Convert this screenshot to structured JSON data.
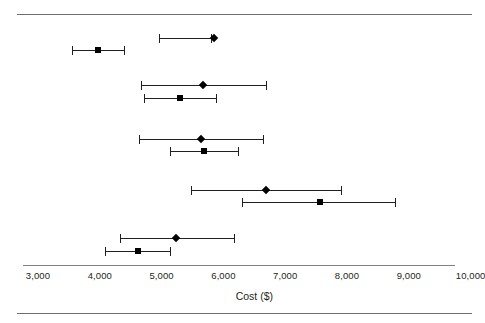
{
  "chart_data": {
    "type": "scatter",
    "title": "",
    "xlabel": "Cost ($)",
    "ylabel": "",
    "xlim": [
      3000,
      10000
    ],
    "grid": false,
    "legend": null,
    "xticks": [
      3000,
      4000,
      5000,
      6000,
      7000,
      8000,
      9000,
      10000
    ],
    "xtick_labels": [
      "3,000",
      "4,000",
      "5,000",
      "6,000",
      "7,000",
      "8,000",
      "9,000",
      "10,000"
    ],
    "orientation": "horizontal-interval",
    "series": [
      {
        "name": "Diamond estimate",
        "marker": "diamond",
        "values": [
          5850,
          5650,
          5640,
          6690,
          5230
        ],
        "ci_low": [
          3960,
          4670,
          4635,
          5475,
          4330
        ],
        "ci_high": [
          5800,
          6690,
          6640,
          7900,
          6170
        ]
      },
      {
        "name": "Square estimate",
        "marker": "square",
        "values": [
          3970,
          5300,
          5690,
          7565,
          4620
        ],
        "ci_low": [
          3550,
          4750,
          5140,
          6300,
          4085
        ],
        "ci_high": [
          4390,
          5880,
          6235,
          8780,
          5140
        ]
      }
    ],
    "rows": [
      {
        "group": 1,
        "diamond": {
          "estimate": 5850,
          "low": 4955,
          "high": 5800
        },
        "square": {
          "estimate": 3970,
          "low": 3550,
          "high": 4390
        }
      },
      {
        "group": 2,
        "diamond": {
          "estimate": 5670,
          "low": 4670,
          "high": 6690
        },
        "square": {
          "estimate": 5300,
          "low": 4715,
          "high": 5880
        }
      },
      {
        "group": 3,
        "diamond": {
          "estimate": 5640,
          "low": 4635,
          "high": 6640
        },
        "square": {
          "estimate": 5690,
          "low": 5140,
          "high": 6235
        }
      },
      {
        "group": 4,
        "diamond": {
          "estimate": 6690,
          "low": 5475,
          "high": 7900
        },
        "square": {
          "estimate": 7565,
          "low": 6300,
          "high": 8780
        }
      },
      {
        "group": 5,
        "diamond": {
          "estimate": 5235,
          "low": 4330,
          "high": 6170
        },
        "square": {
          "estimate": 4620,
          "low": 4085,
          "high": 5140
        }
      }
    ]
  },
  "geometry": {
    "x_origin_px": 38,
    "px_per_1000": 61.8,
    "rows_px": [
      {
        "diamond_y": 33,
        "square_y": 45
      },
      {
        "diamond_y": 80,
        "square_y": 93
      },
      {
        "diamond_y": 134,
        "square_y": 146
      },
      {
        "diamond_y": 185,
        "square_y": 197
      },
      {
        "diamond_y": 233,
        "square_y": 246
      }
    ]
  },
  "colors": {
    "marker": "#000000",
    "line": "#231f20",
    "axis": "#808285",
    "rule": "#6d6e71",
    "background": "#ffffff"
  }
}
